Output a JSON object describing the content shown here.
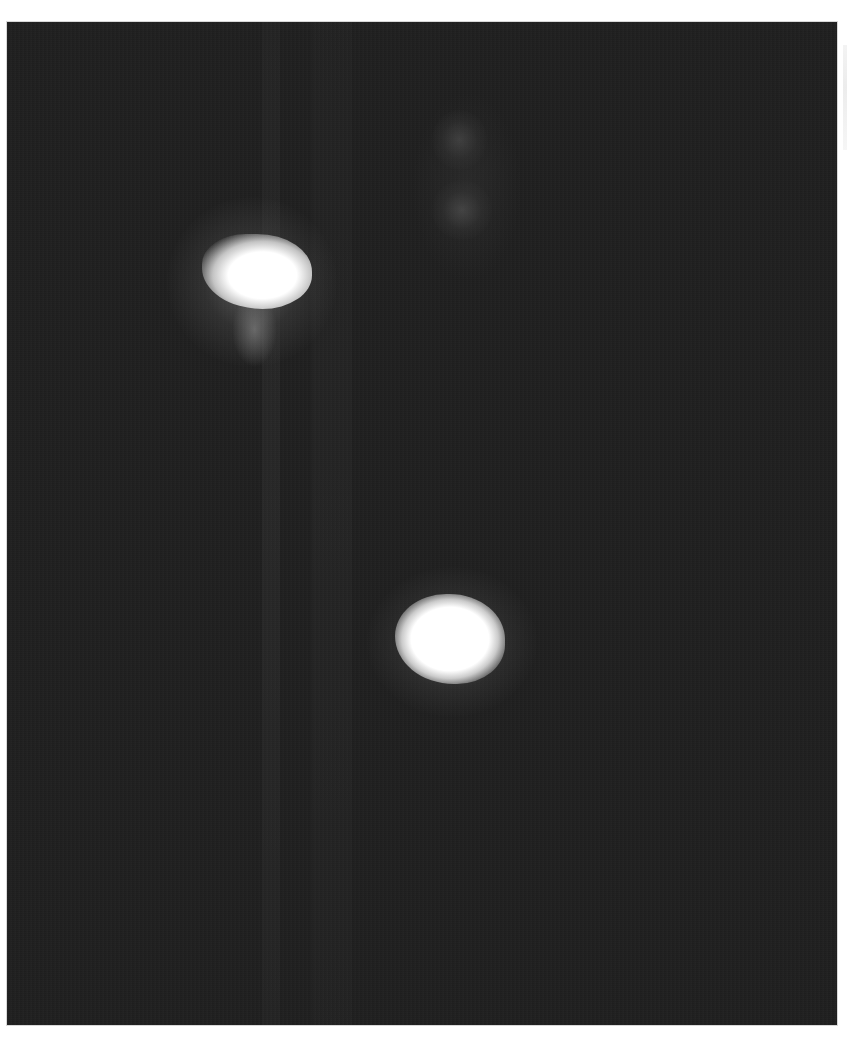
{
  "image": {
    "description": "Grayscale fluorescence microscopy field with two bright cell nuclei on a dark background",
    "background_color": "#1f1f1f",
    "page_background": "#ffffff",
    "frame": {
      "left": 7,
      "top": 22,
      "width": 830,
      "height": 1003
    },
    "objects": [
      {
        "name": "bright-nucleus-upper-left",
        "cx": 250,
        "cy": 255,
        "w": 95,
        "h": 65,
        "color": "#ffffff"
      },
      {
        "name": "bright-nucleus-center-bottom",
        "cx": 445,
        "cy": 628,
        "w": 90,
        "h": 75,
        "color": "#ffffff"
      },
      {
        "name": "faint-spot-top",
        "cx": 455,
        "cy": 135,
        "w": 40,
        "h": 50,
        "color": "#3a3a3a"
      },
      {
        "name": "faint-spot-mid",
        "cx": 455,
        "cy": 205,
        "w": 40,
        "h": 45,
        "color": "#3a3a3a"
      }
    ]
  }
}
